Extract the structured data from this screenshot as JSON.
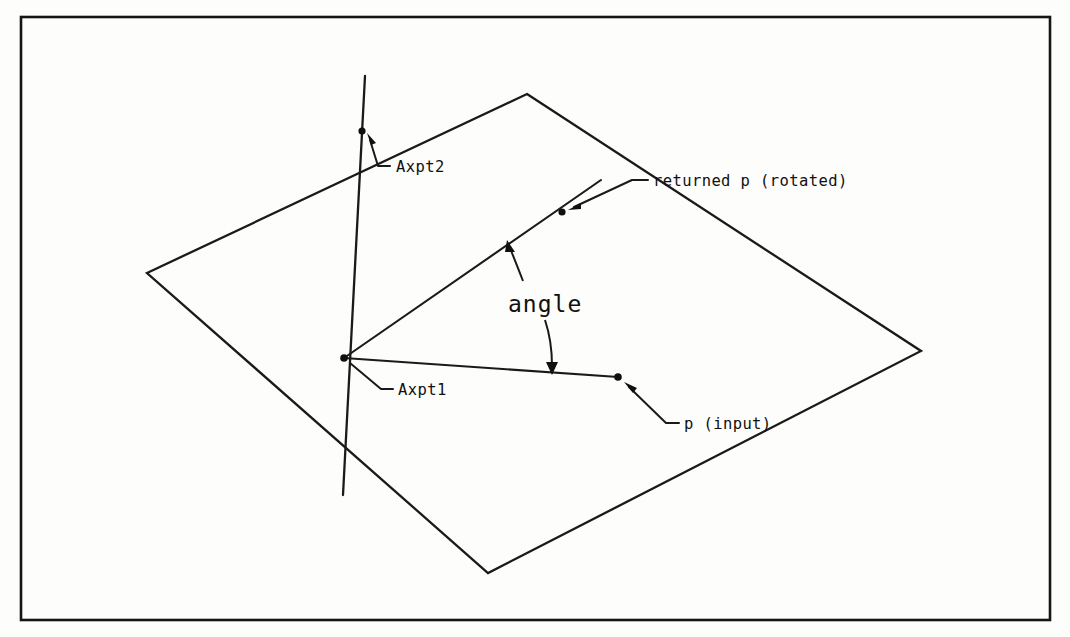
{
  "figure": {
    "background_color": "#fdfdfb",
    "ink_color": "#151515"
  },
  "frame": {
    "name": "page-border",
    "x": 21,
    "y": 17,
    "width": 1029,
    "height": 603
  },
  "plane": {
    "name": "reference-plane",
    "vertices": [
      [
        527,
        94
      ],
      [
        921,
        351
      ],
      [
        488,
        573
      ],
      [
        147,
        273
      ]
    ]
  },
  "axis": {
    "name": "rotation-axis",
    "start": [
      365,
      76
    ],
    "end": [
      343,
      495
    ]
  },
  "rays": [
    {
      "name": "rotated-p-ray",
      "from": [
        344,
        358
      ],
      "to": [
        601,
        180
      ]
    },
    {
      "name": "input-p-ray",
      "from": [
        344,
        358
      ],
      "to": [
        618,
        377
      ]
    }
  ],
  "points": [
    {
      "name": "axpt2-point",
      "label": "Axpt2",
      "x": 362,
      "y": 131,
      "label_x": 396,
      "label_y": 172,
      "leader": [
        [
          390,
          166
        ],
        [
          378,
          166
        ],
        [
          370,
          140
        ]
      ]
    },
    {
      "name": "axpt1-point",
      "label": "Axpt1",
      "x": 344,
      "y": 358,
      "label_x": 398,
      "label_y": 395,
      "leader": [
        [
          393,
          389
        ],
        [
          381,
          389
        ],
        [
          352,
          364
        ]
      ]
    },
    {
      "name": "returned-p-point",
      "label": "returned p (rotated)",
      "x": 562,
      "y": 212,
      "label_x": 653,
      "label_y": 186,
      "leader": [
        [
          648,
          180
        ],
        [
          632,
          180
        ],
        [
          572,
          208
        ]
      ]
    },
    {
      "name": "input-p-point",
      "label": "p (input)",
      "x": 618,
      "y": 377,
      "label_x": 684,
      "label_y": 429,
      "leader": [
        [
          679,
          423
        ],
        [
          666,
          423
        ],
        [
          627,
          385
        ]
      ]
    }
  ],
  "angle_annotation": {
    "name": "angle-annotation",
    "label": "angle",
    "label_x": 512,
    "label_y": 310,
    "arrow_to_rotated": {
      "path": "M 523 281 C 518 268 514 258 510 248",
      "tip": [
        509,
        243
      ]
    },
    "arrow_to_input": {
      "path": "M 545 320 C 550 338 551 352 552 366",
      "tip": [
        552,
        372
      ]
    }
  },
  "labels": {
    "axpt2": "Axpt2",
    "axpt1": "Axpt1",
    "returned_p": "returned p (rotated)",
    "input_p": "p (input)",
    "angle": "angle"
  }
}
